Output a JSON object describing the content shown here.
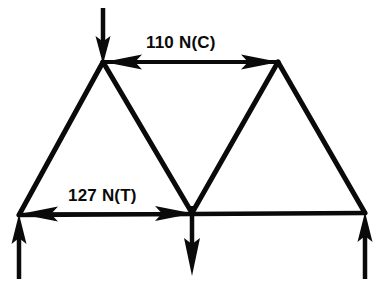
{
  "figure": {
    "background_color": "#ffffff",
    "line_color": "#0a0a0a",
    "width": 378,
    "height": 288
  },
  "annotations": {
    "top_chord": {
      "label": "110 N(C)",
      "magnitude": "110",
      "unit": "N",
      "state": "C",
      "state_meaning": "Compression",
      "arrow": "double-headed-horizontal"
    },
    "bottom_chord": {
      "label": "127 N(T)",
      "magnitude": "127",
      "unit": "N",
      "state": "T",
      "state_meaning": "Tension",
      "arrow": "double-headed-horizontal"
    }
  },
  "truss": {
    "nodes": [
      {
        "id": "bottom-left",
        "x": 19,
        "y": 215
      },
      {
        "id": "bottom-center",
        "x": 192,
        "y": 213
      },
      {
        "id": "bottom-right",
        "x": 365,
        "y": 213
      },
      {
        "id": "top-left",
        "x": 103,
        "y": 62
      },
      {
        "id": "top-right",
        "x": 278,
        "y": 62
      }
    ],
    "members": [
      {
        "id": "left-rafter",
        "from": "bottom-left",
        "to": "top-left"
      },
      {
        "id": "left-inner-diagonal",
        "from": "top-left",
        "to": "bottom-center"
      },
      {
        "id": "right-inner-diagonal",
        "from": "bottom-center",
        "to": "top-right"
      },
      {
        "id": "right-rafter",
        "from": "top-right",
        "to": "bottom-right"
      },
      {
        "id": "top-chord",
        "from": "top-left",
        "to": "top-right"
      },
      {
        "id": "bottom-chord",
        "from": "bottom-left",
        "to": "bottom-right"
      }
    ],
    "loads": [
      {
        "id": "applied-load-top-left",
        "node": "top-left",
        "direction": "down",
        "x": 103,
        "tail_y": 8,
        "head_y": 62
      },
      {
        "id": "applied-load-center",
        "node": "bottom-center",
        "direction": "down",
        "x": 192,
        "tail_y": 213,
        "head_y": 274
      },
      {
        "id": "reaction-left",
        "node": "bottom-left",
        "direction": "up",
        "x": 19,
        "tail_y": 277,
        "head_y": 216
      },
      {
        "id": "reaction-right",
        "node": "bottom-right",
        "direction": "up",
        "x": 365,
        "tail_y": 277,
        "head_y": 214
      }
    ],
    "dimension_arrows": [
      {
        "id": "top-chord-force-arrow",
        "y": 62,
        "x1": 106,
        "x2": 277
      },
      {
        "id": "bottom-chord-force-arrow",
        "y": 214,
        "x1": 22,
        "x2": 191
      }
    ]
  }
}
